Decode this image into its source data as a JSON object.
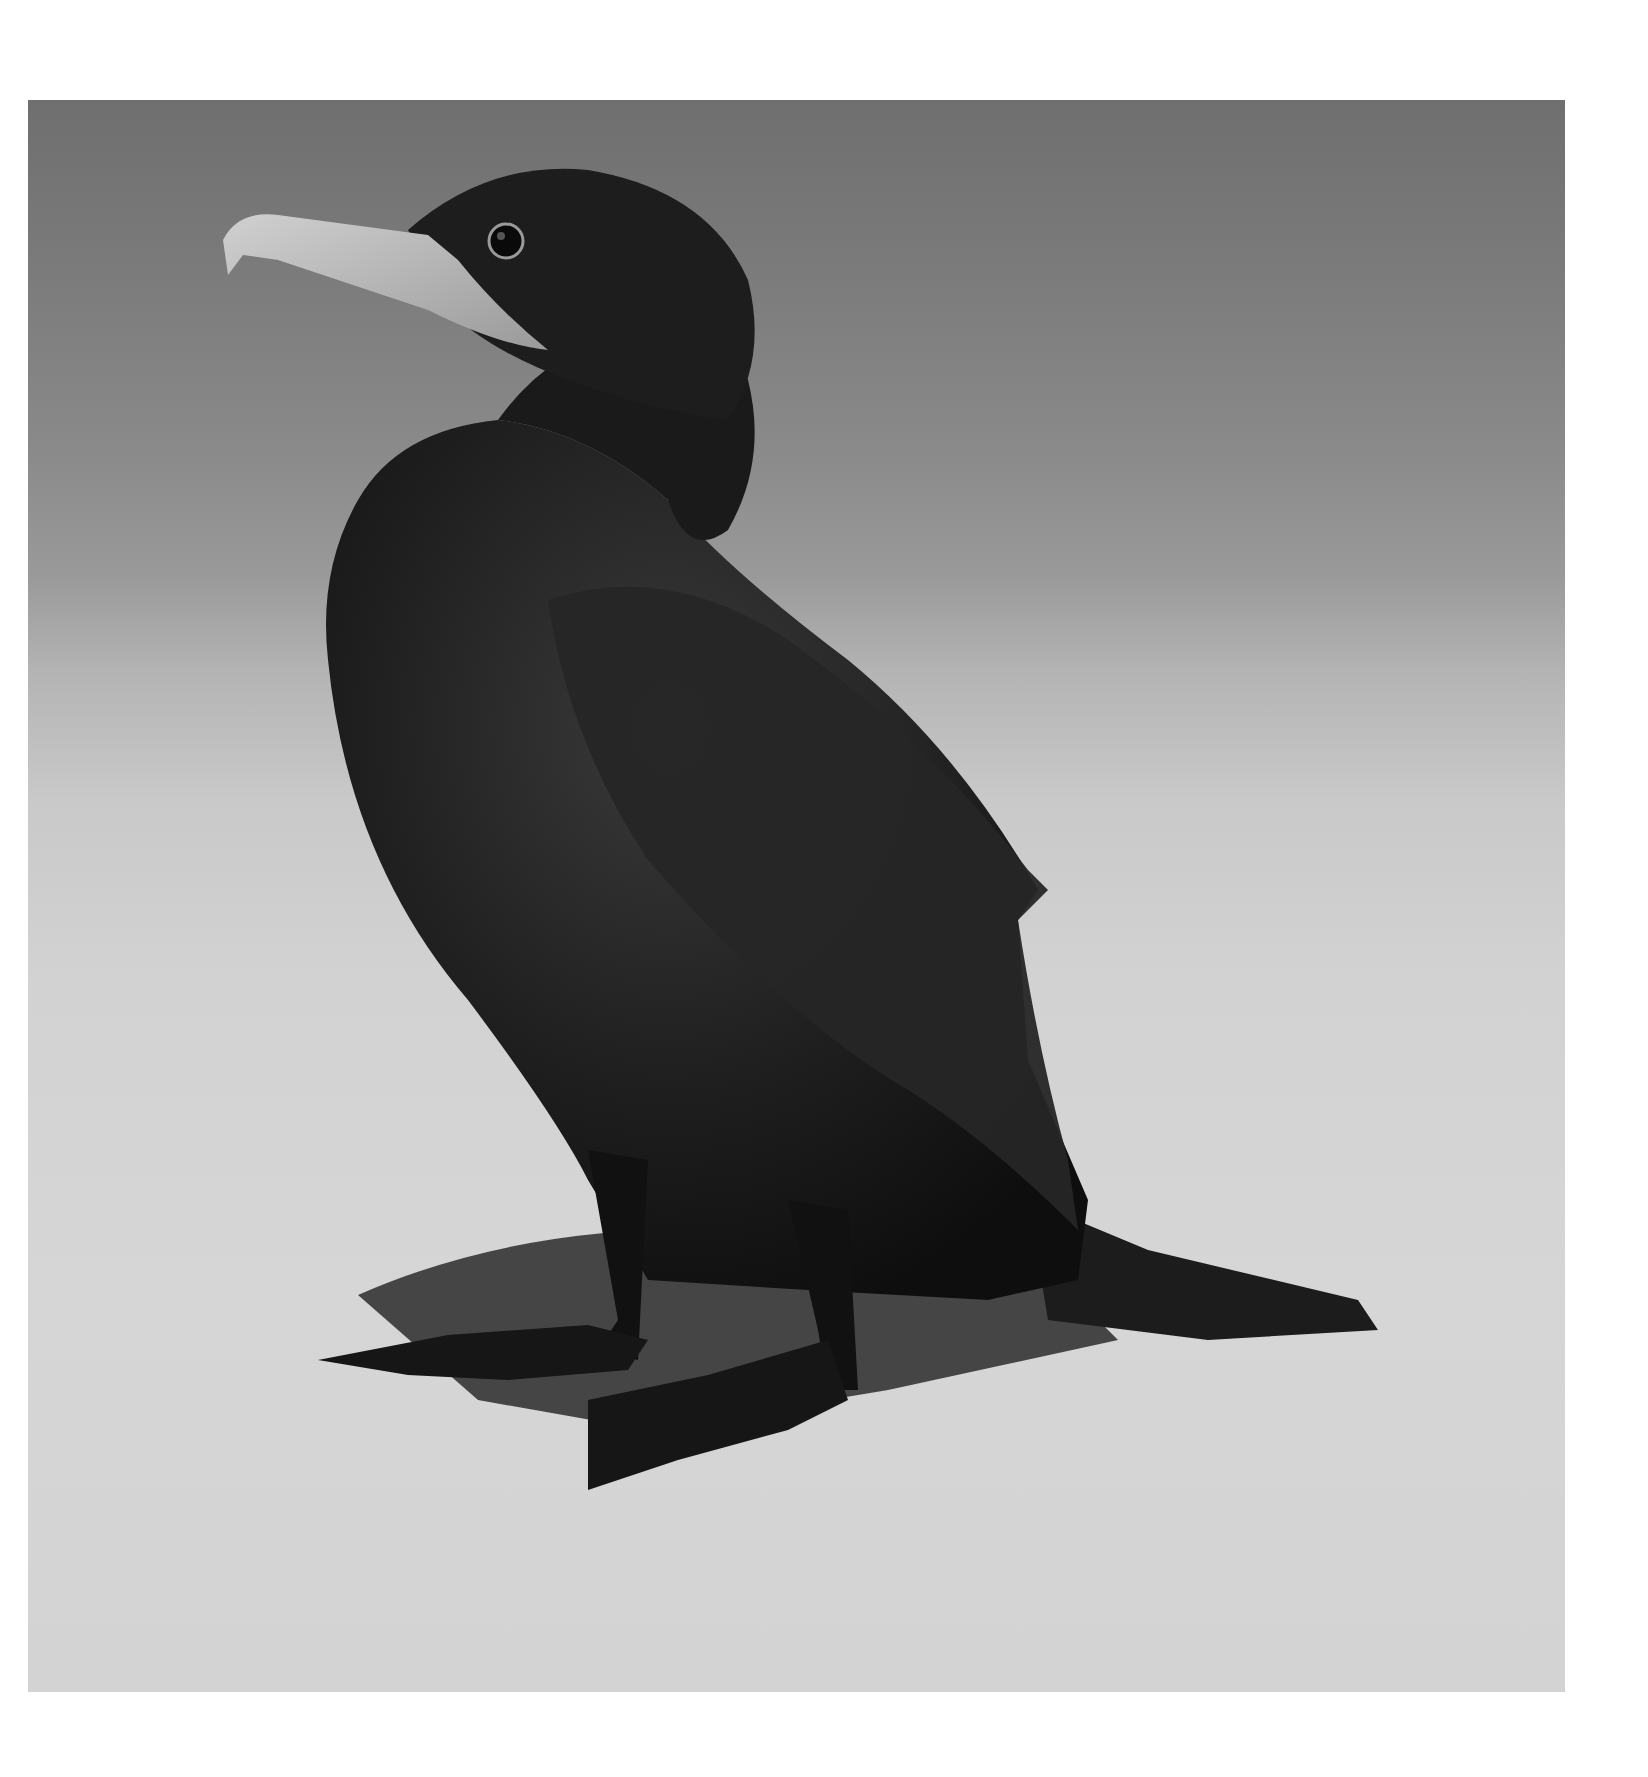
{
  "image": {
    "subject": "Cormorant standing on sandy ground",
    "style": "black-and-white photograph",
    "colors": {
      "page_background": "#ffffff",
      "sky_water_background": "#7a7a7a",
      "ground": "#d4d4d4",
      "bird_body": "#1a1a1a",
      "beak": "#bdbdbd",
      "shadow": "#2a2a2a"
    }
  }
}
